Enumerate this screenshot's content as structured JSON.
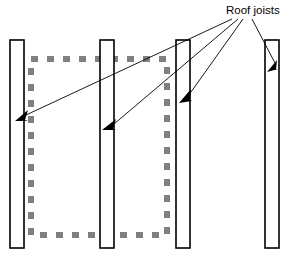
{
  "diagram": {
    "title_label": "Roof joists",
    "colors": {
      "joist_fill": "#ffffff",
      "joist_stroke": "#000000",
      "dashed_outline": "#808080",
      "leader_line": "#000000",
      "background": "#ffffff"
    },
    "joists": [
      {
        "name": "joist-1",
        "x": 10,
        "y": 40,
        "width": 14,
        "height": 208
      },
      {
        "name": "joist-2",
        "x": 100,
        "y": 40,
        "width": 14,
        "height": 208
      },
      {
        "name": "joist-3",
        "x": 176,
        "y": 40,
        "width": 14,
        "height": 208
      },
      {
        "name": "joist-4",
        "x": 265,
        "y": 40,
        "width": 14,
        "height": 208
      }
    ],
    "dashed_region": {
      "name": "room-outline",
      "x": 31,
      "y": 59,
      "width": 136,
      "height": 176,
      "stroke_width": 6,
      "dash": "7 9"
    },
    "leaders": [
      {
        "name": "leader-joist-1",
        "x1": 232,
        "y1": 19,
        "x2": 22,
        "y2": 117
      },
      {
        "name": "leader-joist-2",
        "x1": 238,
        "y1": 19,
        "x2": 111,
        "y2": 127
      },
      {
        "name": "leader-joist-3",
        "x1": 243,
        "y1": 19,
        "x2": 188,
        "y2": 94
      },
      {
        "name": "leader-joist-4",
        "x1": 252,
        "y1": 19,
        "x2": 274,
        "y2": 66
      }
    ],
    "label_position": {
      "x": 226,
      "y": 14
    }
  },
  "chart_data": {
    "type": "table",
    "title": "Roof joists",
    "categories": [
      "joist-1",
      "joist-2",
      "joist-3",
      "joist-4"
    ],
    "values": [
      208,
      208,
      208,
      208
    ],
    "xlabel": "",
    "ylabel": ""
  }
}
